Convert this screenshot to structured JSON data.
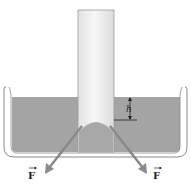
{
  "diagram": {
    "labels": {
      "height": "h",
      "force_left": "F",
      "force_right": "F"
    },
    "colors": {
      "liquid": "#a4a4a4",
      "liquid_edge": "#8c8c8c",
      "tube": "#ececec",
      "tube_edge": "#9a9a9a",
      "vessel": "#8a8a8a",
      "arrow": "#8a8a8a",
      "text": "#222222"
    }
  }
}
